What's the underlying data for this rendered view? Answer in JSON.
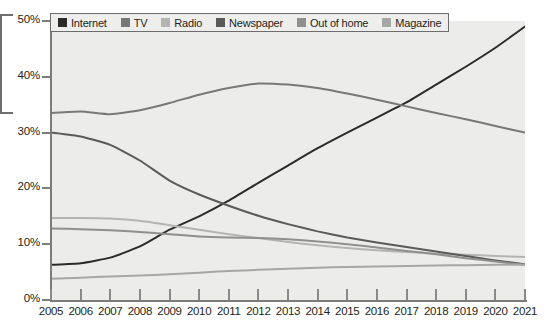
{
  "chart_data": {
    "type": "line",
    "title": "",
    "subtitle": "",
    "xlabel": "",
    "ylabel": "",
    "grid": false,
    "legend_position": "top-left",
    "xlim": [
      2005,
      2021
    ],
    "ylim": [
      0,
      50
    ],
    "y_tick_labels": [
      "0%",
      "10%",
      "20%",
      "30%",
      "40%",
      "50%"
    ],
    "y_tick_values": [
      0,
      10,
      20,
      30,
      40,
      50
    ],
    "x": [
      2005,
      2006,
      2007,
      2008,
      2009,
      2010,
      2011,
      2012,
      2013,
      2014,
      2015,
      2016,
      2017,
      2018,
      2019,
      2020,
      2021
    ],
    "x_tick_labels": [
      "2005",
      "2006",
      "2007",
      "2008",
      "2009",
      "2010",
      "2011",
      "2012",
      "2013",
      "2014",
      "2015",
      "2016",
      "2017",
      "2018",
      "2019",
      "2020",
      "2021"
    ],
    "series": [
      {
        "name": "Internet",
        "color": "#2b2b2b",
        "values": [
          6.3,
          6.6,
          7.6,
          9.6,
          12.6,
          15.0,
          17.8,
          21.0,
          24.1,
          27.2,
          30.0,
          32.7,
          35.4,
          38.6,
          41.8,
          45.2,
          49.0
        ]
      },
      {
        "name": "TV",
        "color": "#787878",
        "values": [
          33.5,
          33.8,
          33.3,
          34.0,
          35.3,
          36.8,
          38.0,
          38.8,
          38.6,
          38.0,
          37.0,
          35.9,
          34.7,
          33.5,
          32.4,
          31.2,
          30.0
        ]
      },
      {
        "name": "Radio",
        "color": "#b4b4b4",
        "values": [
          14.7,
          14.7,
          14.6,
          14.2,
          13.4,
          12.6,
          11.8,
          11.1,
          10.4,
          9.8,
          9.3,
          8.9,
          8.6,
          8.3,
          8.1,
          7.9,
          7.7
        ]
      },
      {
        "name": "Newspaper",
        "color": "#5a5a5a",
        "values": [
          30.0,
          29.3,
          27.8,
          25.0,
          21.4,
          18.9,
          16.9,
          15.1,
          13.6,
          12.3,
          11.2,
          10.3,
          9.5,
          8.7,
          7.9,
          7.1,
          6.4
        ]
      },
      {
        "name": "Out of home",
        "color": "#8f8f8f",
        "values": [
          12.8,
          12.7,
          12.5,
          12.2,
          11.8,
          11.4,
          11.2,
          11.1,
          10.9,
          10.5,
          10.0,
          9.4,
          8.8,
          8.2,
          7.5,
          6.9,
          6.3
        ]
      },
      {
        "name": "Magazine",
        "color": "#a6a6a6",
        "values": [
          3.8,
          4.0,
          4.2,
          4.4,
          4.6,
          4.9,
          5.2,
          5.4,
          5.6,
          5.8,
          5.9,
          6.0,
          6.1,
          6.2,
          6.25,
          6.3,
          6.3
        ]
      }
    ]
  },
  "legend": {
    "items": [
      {
        "label": "Internet",
        "color": "#2b2b2b"
      },
      {
        "label": "TV",
        "color": "#787878"
      },
      {
        "label": "Radio",
        "color": "#b4b4b4"
      },
      {
        "label": "Newspaper",
        "color": "#5a5a5a"
      },
      {
        "label": "Out of home",
        "color": "#8f8f8f"
      },
      {
        "label": "Magazine",
        "color": "#a6a6a6"
      }
    ]
  }
}
